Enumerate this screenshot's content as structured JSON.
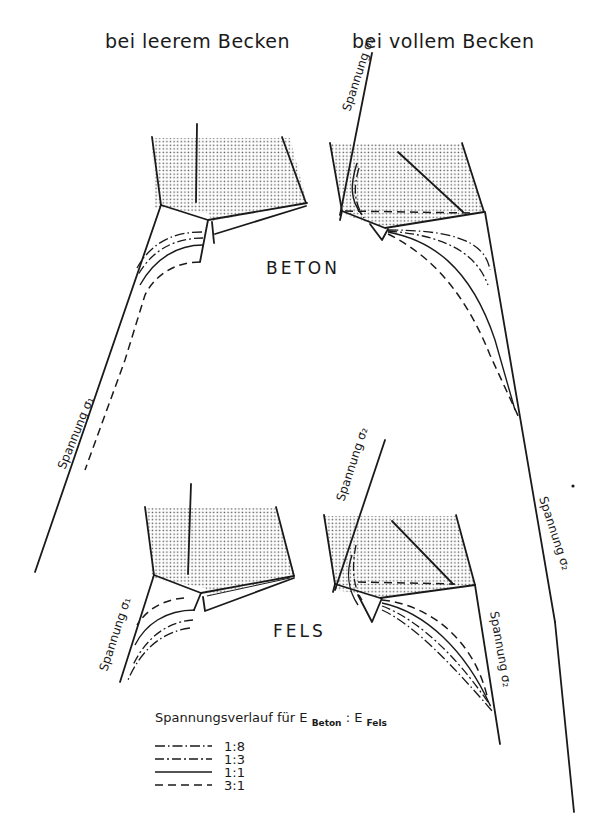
{
  "headings": {
    "left": "bei leerem Becken",
    "right": "bei vollem Becken"
  },
  "sections": {
    "top": "BETON",
    "bottom": "FELS"
  },
  "axis_labels": {
    "beton_left": "Spannung σ₁",
    "beton_right_top": "Spannung σ₂",
    "beton_right_long": "Spannung σ₂",
    "fels_left": "Spannung σ₁",
    "fels_right_top": "Spannung σ₂",
    "fels_right": "Spannung σ₂"
  },
  "legend": {
    "title": "Spannungsverlauf für E",
    "sub1": "Beton",
    "sep": " : E",
    "sub2": "Fels",
    "items": [
      {
        "style": "dash-dot-long",
        "label": "1:8"
      },
      {
        "style": "dash-dot",
        "label": "1:3"
      },
      {
        "style": "solid",
        "label": "1:1"
      },
      {
        "style": "dashed",
        "label": "3:1"
      }
    ]
  },
  "colors": {
    "ink": "#1a1a1a",
    "hatch": "#555555",
    "background": "#ffffff"
  }
}
